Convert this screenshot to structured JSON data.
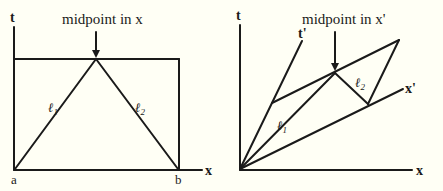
{
  "colors": {
    "background": "#fffff5",
    "ink": "#1a1a1a"
  },
  "left_diagram": {
    "caption": "midpoint in x",
    "t_axis_label": "t",
    "x_axis_label": "x",
    "point_a": "a",
    "point_b": "b",
    "line1_label": "ℓ",
    "line1_sub": "1",
    "line2_label": "ℓ",
    "line2_sub": "2"
  },
  "right_diagram": {
    "caption": "midpoint in x'",
    "t_axis_label": "t",
    "x_axis_label": "x",
    "t_prime_label": "t'",
    "x_prime_label": "x'",
    "line1_label": "ℓ",
    "line1_sub": "1",
    "line2_label": "ℓ",
    "line2_sub": "2"
  }
}
